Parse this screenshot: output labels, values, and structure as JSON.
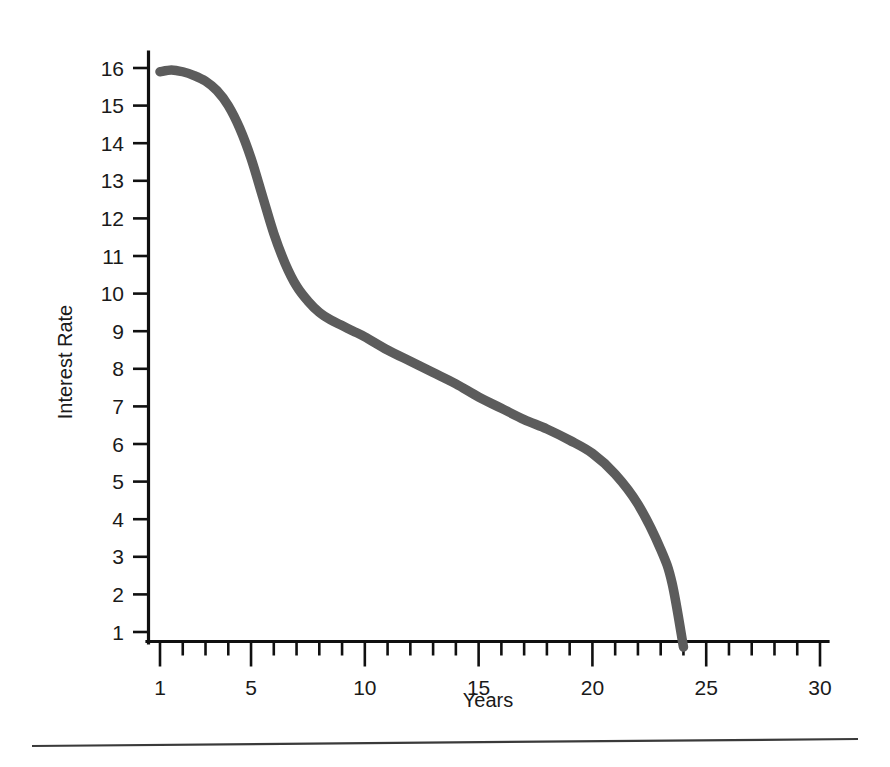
{
  "figure": {
    "background_color": "#ffffff",
    "curve_color": "#5c5c5c",
    "axis_color": "#101010",
    "footer_rule": "horizontal-rule"
  },
  "chart_data": {
    "type": "line",
    "title": "",
    "subtitle": "",
    "xlabel": "Years",
    "ylabel": "Interest Rate",
    "xlim": [
      0.6,
      30.4
    ],
    "ylim": [
      0.45,
      16.4
    ],
    "grid": false,
    "legend": null,
    "legend_position": "none",
    "x_tick_labels": [
      "1",
      "5",
      "10",
      "15",
      "20",
      "25",
      "30"
    ],
    "x_major_ticks": [
      1,
      5,
      10,
      15,
      20,
      25,
      30
    ],
    "x_minor_ticks": [
      2,
      3,
      4,
      6,
      7,
      8,
      9,
      11,
      12,
      13,
      14,
      16,
      17,
      18,
      19,
      21,
      22,
      23,
      24,
      26,
      27,
      28,
      29
    ],
    "y_tick_labels": [
      "1",
      "2",
      "3",
      "4",
      "5",
      "6",
      "7",
      "8",
      "9",
      "10",
      "11",
      "12",
      "13",
      "14",
      "15",
      "16"
    ],
    "y_major_ticks": [
      1,
      2,
      3,
      4,
      5,
      6,
      7,
      8,
      9,
      10,
      11,
      12,
      13,
      14,
      15,
      16
    ],
    "series": [
      {
        "name": "Interest Rate",
        "color": "#5c5c5c",
        "x": [
          1,
          1.5,
          2,
          2.5,
          3,
          3.5,
          4,
          4.5,
          5,
          5.5,
          6,
          6.5,
          7,
          7.5,
          8,
          8.5,
          9,
          9.5,
          10,
          11,
          12,
          13,
          14,
          15,
          16,
          17,
          18,
          19,
          20,
          21,
          22,
          23,
          23.5,
          24
        ],
        "y": [
          15.9,
          15.95,
          15.9,
          15.8,
          15.65,
          15.4,
          15.0,
          14.4,
          13.6,
          12.6,
          11.6,
          10.8,
          10.2,
          9.8,
          9.5,
          9.3,
          9.15,
          9.0,
          8.85,
          8.5,
          8.2,
          7.9,
          7.6,
          7.25,
          6.95,
          6.65,
          6.4,
          6.1,
          5.75,
          5.2,
          4.4,
          3.2,
          2.3,
          0.6
        ]
      }
    ],
    "annotations": [
      {
        "label": "curve starts at year 1 near 16",
        "x": 1,
        "y": 15.9
      },
      {
        "label": "curve reaches baseline near year 24",
        "x": 24,
        "y": 0.6
      }
    ]
  },
  "labels": {
    "y_axis_title": "Interest Rate",
    "x_axis_title": "Years"
  }
}
